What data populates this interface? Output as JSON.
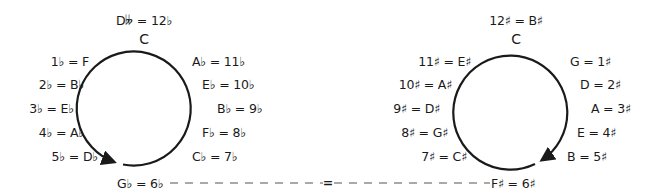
{
  "flats_circle": {
    "top_label": "D𝄫 = 12♭",
    "center_note": "C",
    "left_labels": [
      "1♭ = F",
      "2♭ = B♭",
      "3♭ = E♭",
      "4♭ = A♭",
      "5♭ = D♭"
    ],
    "right_labels": [
      "A♭ = 11♭",
      "E♭ = 10♭",
      "B♭ = 9♭",
      "F♭ = 8♭",
      "C♭ = 7♭"
    ],
    "bottom_label": "G♭ = 6♭",
    "direction": "counterclockwise"
  },
  "sharps_circle": {
    "top_label": "12♯ = B♯",
    "center_note": "C",
    "left_labels": [
      "11♯ = E♯",
      "10♯ = A♯",
      "9♯ = D♯",
      "8♯ = G♯",
      "7♯ = C♯"
    ],
    "right_labels": [
      "G = 1♯",
      "D = 2♯",
      "A = 3♯",
      "E = 4♯",
      "B = 5♯"
    ],
    "bottom_label": "F♯ = 6♯",
    "direction": "clockwise"
  },
  "connector": {
    "symbol": "="
  },
  "colors": {
    "stroke": "#1a1a1a",
    "dash": "#555555",
    "background": "#ffffff"
  }
}
